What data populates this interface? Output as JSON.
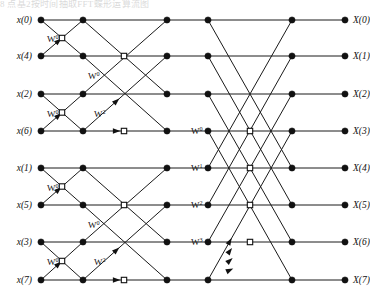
{
  "figure": {
    "clipped_header_text": "8 点基2按时间抽取FFT蝶形运算流图",
    "stage_count": 3,
    "point_count": 8,
    "line_color": "#1a1a1a",
    "node_color": "#111111",
    "background_color": "#ffffff"
  },
  "inputs": [
    {
      "label": "x(0)",
      "row": 0
    },
    {
      "label": "x(4)",
      "row": 1
    },
    {
      "label": "x(2)",
      "row": 2
    },
    {
      "label": "x(6)",
      "row": 3
    },
    {
      "label": "x(1)",
      "row": 4
    },
    {
      "label": "x(5)",
      "row": 5
    },
    {
      "label": "x(3)",
      "row": 6
    },
    {
      "label": "x(7)",
      "row": 7
    }
  ],
  "outputs": [
    {
      "label": "X(0)",
      "row": 0
    },
    {
      "label": "X(1)",
      "row": 1
    },
    {
      "label": "X(2)",
      "row": 2
    },
    {
      "label": "X(3)",
      "row": 3
    },
    {
      "label": "X(4)",
      "row": 4
    },
    {
      "label": "X(5)",
      "row": 5
    },
    {
      "label": "X(6)",
      "row": 6
    },
    {
      "label": "X(7)",
      "row": 7
    }
  ],
  "geometry": {
    "columns": [
      41,
      83,
      124,
      167,
      208,
      250,
      292,
      345
    ],
    "rows": [
      20,
      56,
      94,
      131,
      168,
      205,
      242,
      280
    ],
    "dot_radius": 3.1,
    "hollow_size": 5.4
  },
  "twiddles": [
    {
      "base": "W",
      "exp": "0",
      "x": 47,
      "y": 42,
      "stage": 1
    },
    {
      "base": "W",
      "exp": "0",
      "x": 47,
      "y": 117,
      "stage": 1
    },
    {
      "base": "W",
      "exp": "0",
      "x": 47,
      "y": 191,
      "stage": 1
    },
    {
      "base": "W",
      "exp": "0",
      "x": 47,
      "y": 265,
      "stage": 1
    },
    {
      "base": "W",
      "exp": "0",
      "x": 88,
      "y": 79,
      "stage": 2
    },
    {
      "base": "W",
      "exp": "2",
      "x": 94,
      "y": 117,
      "stage": 2
    },
    {
      "base": "W",
      "exp": "0",
      "x": 88,
      "y": 228,
      "stage": 2
    },
    {
      "base": "W",
      "exp": "2",
      "x": 94,
      "y": 265,
      "stage": 2
    },
    {
      "base": "W",
      "exp": "0",
      "x": 191,
      "y": 134,
      "stage": 3
    },
    {
      "base": "W",
      "exp": "1",
      "x": 191,
      "y": 171,
      "stage": 3
    },
    {
      "base": "W",
      "exp": "2",
      "x": 191,
      "y": 208,
      "stage": 3
    },
    {
      "base": "W",
      "exp": "3",
      "x": 191,
      "y": 245,
      "stage": 3
    }
  ],
  "nodes_filled": [
    {
      "col": 0,
      "row": 0
    },
    {
      "col": 0,
      "row": 1
    },
    {
      "col": 0,
      "row": 2
    },
    {
      "col": 0,
      "row": 3
    },
    {
      "col": 0,
      "row": 4
    },
    {
      "col": 0,
      "row": 5
    },
    {
      "col": 0,
      "row": 6
    },
    {
      "col": 0,
      "row": 7
    },
    {
      "col": 1,
      "row": 0
    },
    {
      "col": 1,
      "row": 1
    },
    {
      "col": 1,
      "row": 2
    },
    {
      "col": 1,
      "row": 3
    },
    {
      "col": 1,
      "row": 4
    },
    {
      "col": 1,
      "row": 5
    },
    {
      "col": 1,
      "row": 6
    },
    {
      "col": 1,
      "row": 7
    },
    {
      "col": 3,
      "row": 0
    },
    {
      "col": 3,
      "row": 1
    },
    {
      "col": 3,
      "row": 2
    },
    {
      "col": 3,
      "row": 3
    },
    {
      "col": 3,
      "row": 4
    },
    {
      "col": 3,
      "row": 5
    },
    {
      "col": 3,
      "row": 6
    },
    {
      "col": 3,
      "row": 7
    },
    {
      "col": 4,
      "row": 0
    },
    {
      "col": 4,
      "row": 1
    },
    {
      "col": 4,
      "row": 2
    },
    {
      "col": 4,
      "row": 3
    },
    {
      "col": 4,
      "row": 4
    },
    {
      "col": 4,
      "row": 5
    },
    {
      "col": 4,
      "row": 6
    },
    {
      "col": 4,
      "row": 7
    },
    {
      "col": 6,
      "row": 0
    },
    {
      "col": 6,
      "row": 1
    },
    {
      "col": 6,
      "row": 2
    },
    {
      "col": 6,
      "row": 3
    },
    {
      "col": 6,
      "row": 4
    },
    {
      "col": 6,
      "row": 5
    },
    {
      "col": 6,
      "row": 6
    },
    {
      "col": 6,
      "row": 7
    },
    {
      "col": 7,
      "row": 0
    },
    {
      "col": 7,
      "row": 1
    },
    {
      "col": 7,
      "row": 2
    },
    {
      "col": 7,
      "row": 3
    },
    {
      "col": 7,
      "row": 4
    },
    {
      "col": 7,
      "row": 5
    },
    {
      "col": 7,
      "row": 6
    },
    {
      "col": 7,
      "row": 7
    }
  ],
  "nodes_hollow": [
    {
      "col": 0.5,
      "row": 0.5
    },
    {
      "col": 0.5,
      "row": 2.5
    },
    {
      "col": 0.5,
      "row": 4.5
    },
    {
      "col": 0.5,
      "row": 6.5
    },
    {
      "col": 2,
      "row": 1
    },
    {
      "col": 2,
      "row": 3
    },
    {
      "col": 2,
      "row": 5
    },
    {
      "col": 2,
      "row": 7
    },
    {
      "col": 5,
      "row": 3
    },
    {
      "col": 5,
      "row": 4
    },
    {
      "col": 5,
      "row": 5
    },
    {
      "col": 5,
      "row": 6
    }
  ],
  "edges": [
    {
      "c1": 0,
      "r1": 0,
      "c2": 1,
      "r2": 0
    },
    {
      "c1": 0,
      "r1": 0,
      "c2": 1,
      "r2": 1
    },
    {
      "c1": 0,
      "r1": 1,
      "c2": 1,
      "r2": 0
    },
    {
      "c1": 0,
      "r1": 1,
      "c2": 1,
      "r2": 1
    },
    {
      "c1": 0,
      "r1": 2,
      "c2": 1,
      "r2": 2
    },
    {
      "c1": 0,
      "r1": 2,
      "c2": 1,
      "r2": 3
    },
    {
      "c1": 0,
      "r1": 3,
      "c2": 1,
      "r2": 2
    },
    {
      "c1": 0,
      "r1": 3,
      "c2": 1,
      "r2": 3
    },
    {
      "c1": 0,
      "r1": 4,
      "c2": 1,
      "r2": 4
    },
    {
      "c1": 0,
      "r1": 4,
      "c2": 1,
      "r2": 5
    },
    {
      "c1": 0,
      "r1": 5,
      "c2": 1,
      "r2": 4
    },
    {
      "c1": 0,
      "r1": 5,
      "c2": 1,
      "r2": 5
    },
    {
      "c1": 0,
      "r1": 6,
      "c2": 1,
      "r2": 6
    },
    {
      "c1": 0,
      "r1": 6,
      "c2": 1,
      "r2": 7
    },
    {
      "c1": 0,
      "r1": 7,
      "c2": 1,
      "r2": 6
    },
    {
      "c1": 0,
      "r1": 7,
      "c2": 1,
      "r2": 7
    },
    {
      "c1": 1,
      "r1": 0,
      "c2": 3,
      "r2": 0
    },
    {
      "c1": 1,
      "r1": 0,
      "c2": 3,
      "r2": 2
    },
    {
      "c1": 1,
      "r1": 1,
      "c2": 3,
      "r2": 1
    },
    {
      "c1": 1,
      "r1": 1,
      "c2": 3,
      "r2": 3
    },
    {
      "c1": 1,
      "r1": 2,
      "c2": 3,
      "r2": 0
    },
    {
      "c1": 1,
      "r1": 2,
      "c2": 3,
      "r2": 2
    },
    {
      "c1": 1,
      "r1": 3,
      "c2": 3,
      "r2": 1
    },
    {
      "c1": 1,
      "r1": 3,
      "c2": 3,
      "r2": 3
    },
    {
      "c1": 1,
      "r1": 4,
      "c2": 3,
      "r2": 4
    },
    {
      "c1": 1,
      "r1": 4,
      "c2": 3,
      "r2": 6
    },
    {
      "c1": 1,
      "r1": 5,
      "c2": 3,
      "r2": 5
    },
    {
      "c1": 1,
      "r1": 5,
      "c2": 3,
      "r2": 7
    },
    {
      "c1": 1,
      "r1": 6,
      "c2": 3,
      "r2": 4
    },
    {
      "c1": 1,
      "r1": 6,
      "c2": 3,
      "r2": 6
    },
    {
      "c1": 1,
      "r1": 7,
      "c2": 3,
      "r2": 5
    },
    {
      "c1": 1,
      "r1": 7,
      "c2": 3,
      "r2": 7
    },
    {
      "c1": 3,
      "r1": 0,
      "c2": 4,
      "r2": 0
    },
    {
      "c1": 3,
      "r1": 1,
      "c2": 4,
      "r2": 1
    },
    {
      "c1": 3,
      "r1": 2,
      "c2": 4,
      "r2": 2
    },
    {
      "c1": 3,
      "r1": 3,
      "c2": 4,
      "r2": 3
    },
    {
      "c1": 3,
      "r1": 4,
      "c2": 4,
      "r2": 4
    },
    {
      "c1": 3,
      "r1": 5,
      "c2": 4,
      "r2": 5
    },
    {
      "c1": 3,
      "r1": 6,
      "c2": 4,
      "r2": 6
    },
    {
      "c1": 3,
      "r1": 7,
      "c2": 4,
      "r2": 7
    },
    {
      "c1": 4,
      "r1": 0,
      "c2": 6,
      "r2": 0
    },
    {
      "c1": 4,
      "r1": 0,
      "c2": 6,
      "r2": 4
    },
    {
      "c1": 4,
      "r1": 1,
      "c2": 6,
      "r2": 1
    },
    {
      "c1": 4,
      "r1": 1,
      "c2": 6,
      "r2": 5
    },
    {
      "c1": 4,
      "r1": 2,
      "c2": 6,
      "r2": 2
    },
    {
      "c1": 4,
      "r1": 2,
      "c2": 6,
      "r2": 6
    },
    {
      "c1": 4,
      "r1": 3,
      "c2": 6,
      "r2": 3
    },
    {
      "c1": 4,
      "r1": 3,
      "c2": 6,
      "r2": 7
    },
    {
      "c1": 4,
      "r1": 4,
      "c2": 6,
      "r2": 0
    },
    {
      "c1": 4,
      "r1": 4,
      "c2": 6,
      "r2": 4
    },
    {
      "c1": 4,
      "r1": 5,
      "c2": 6,
      "r2": 1
    },
    {
      "c1": 4,
      "r1": 5,
      "c2": 6,
      "r2": 5
    },
    {
      "c1": 4,
      "r1": 6,
      "c2": 6,
      "r2": 2
    },
    {
      "c1": 4,
      "r1": 6,
      "c2": 6,
      "r2": 6
    },
    {
      "c1": 4,
      "r1": 7,
      "c2": 6,
      "r2": 3
    },
    {
      "c1": 4,
      "r1": 7,
      "c2": 6,
      "r2": 7
    },
    {
      "c1": 6,
      "r1": 0,
      "c2": 7,
      "r2": 0
    },
    {
      "c1": 6,
      "r1": 1,
      "c2": 7,
      "r2": 1
    },
    {
      "c1": 6,
      "r1": 2,
      "c2": 7,
      "r2": 2
    },
    {
      "c1": 6,
      "r1": 3,
      "c2": 7,
      "r2": 3
    },
    {
      "c1": 6,
      "r1": 4,
      "c2": 7,
      "r2": 4
    },
    {
      "c1": 6,
      "r1": 5,
      "c2": 7,
      "r2": 5
    },
    {
      "c1": 6,
      "r1": 6,
      "c2": 7,
      "r2": 6
    },
    {
      "c1": 6,
      "r1": 7,
      "c2": 7,
      "r2": 7
    }
  ],
  "arrows": [
    {
      "c1": 0,
      "r1": 1,
      "c2": 1,
      "r2": 0,
      "t": 0.42
    },
    {
      "c1": 0,
      "r1": 3,
      "c2": 1,
      "r2": 2,
      "t": 0.42
    },
    {
      "c1": 0,
      "r1": 5,
      "c2": 1,
      "r2": 4,
      "t": 0.42
    },
    {
      "c1": 0,
      "r1": 7,
      "c2": 1,
      "r2": 6,
      "t": 0.42
    },
    {
      "c1": 1,
      "r1": 3,
      "c2": 3,
      "r2": 1,
      "t": 0.4
    },
    {
      "c1": 1,
      "r1": 3,
      "c2": 3,
      "r2": 3,
      "t": 0.4
    },
    {
      "c1": 1,
      "r1": 7,
      "c2": 3,
      "r2": 5,
      "t": 0.4
    },
    {
      "c1": 1,
      "r1": 7,
      "c2": 3,
      "r2": 7,
      "t": 0.4
    },
    {
      "c1": 4,
      "r1": 7,
      "c2": 6,
      "r2": 3,
      "t": 0.26
    },
    {
      "c1": 4,
      "r1": 7,
      "c2": 6,
      "r2": 4,
      "t": 0.26
    },
    {
      "c1": 4,
      "r1": 7,
      "c2": 6,
      "r2": 5,
      "t": 0.26
    },
    {
      "c1": 4,
      "r1": 7,
      "c2": 6,
      "r2": 6,
      "t": 0.26
    }
  ]
}
